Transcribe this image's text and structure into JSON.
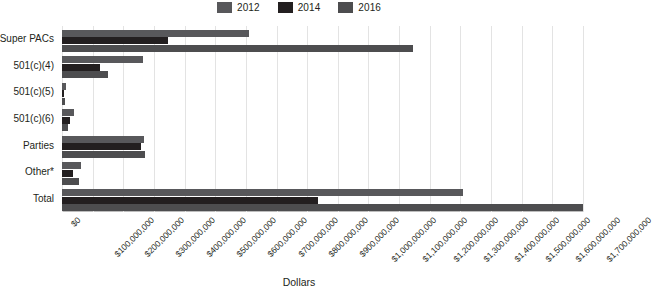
{
  "chart_data": {
    "type": "bar",
    "orientation": "horizontal",
    "title": "",
    "xlabel": "Dollars",
    "ylabel": "",
    "grid": true,
    "legend_position": "top-center",
    "xlim": [
      0,
      1700000000
    ],
    "xtick_step": 100000000,
    "categories": [
      "Super PACs",
      "501(c)(4)",
      "501(c)(5)",
      "501(c)(6)",
      "Parties",
      "Other*",
      "Total"
    ],
    "xticks": [
      "$0",
      "$100,000,000",
      "$200,000,000",
      "$300,000,000",
      "$400,000,000",
      "$500,000,000",
      "$600,000,000",
      "$700,000,000",
      "$800,000,000",
      "$900,000,000",
      "$1,000,000,000",
      "$1,100,000,000",
      "$1,200,000,000",
      "$1,300,000,000",
      "$1,400,000,000",
      "$1,500,000,000",
      "$1,600,000,000",
      "$1,700,000,000"
    ],
    "series": [
      {
        "name": "2012",
        "color": "#58585b",
        "values": [
          610000000,
          265000000,
          12000000,
          40000000,
          268000000,
          63000000,
          1310000000
        ]
      },
      {
        "name": "2014",
        "color": "#231f20",
        "values": [
          345000000,
          125000000,
          5000000,
          25000000,
          258000000,
          37000000,
          835000000
        ]
      },
      {
        "name": "2016",
        "color": "#4d4d4f",
        "values": [
          1145000000,
          150000000,
          9000000,
          20000000,
          270000000,
          55000000,
          1700000000
        ]
      }
    ],
    "footnote_marker": "*"
  },
  "legend": {
    "items": [
      {
        "label": "2012",
        "color": "#58585b"
      },
      {
        "label": "2014",
        "color": "#231f20"
      },
      {
        "label": "2016",
        "color": "#4d4d4f"
      }
    ]
  },
  "axis": {
    "x_title": "Dollars"
  }
}
